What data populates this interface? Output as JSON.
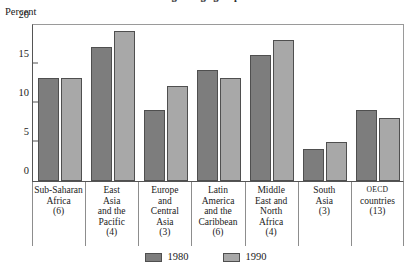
{
  "title": "Percentage of age group enrolled",
  "axis": {
    "ylabel": "Percent",
    "yticks": [
      "0",
      "5",
      "10",
      "15",
      "20"
    ]
  },
  "legend": {
    "items": [
      {
        "label": "1980",
        "color": "#7d7d7d"
      },
      {
        "label": "1990",
        "color": "#a8a8a8"
      }
    ]
  },
  "categories": [
    {
      "lines": [
        "Sub-Saharan",
        "Africa"
      ],
      "count": "(6)"
    },
    {
      "lines": [
        "East",
        "Asia",
        "and the",
        "Pacific"
      ],
      "count": "(4)"
    },
    {
      "lines": [
        "Europe",
        "and",
        "Central",
        "Asia"
      ],
      "count": "(3)"
    },
    {
      "lines": [
        "Latin",
        "America",
        "and the",
        "Caribbean"
      ],
      "count": "(6)"
    },
    {
      "lines": [
        "Middle",
        "East and",
        "North",
        "Africa"
      ],
      "count": "(4)"
    },
    {
      "lines": [
        "South",
        "Asia"
      ],
      "count": "(3)"
    },
    {
      "lines": [
        "OECD",
        "countries"
      ],
      "count": "(13)",
      "smallcaps_first": true
    }
  ],
  "chart_data": {
    "type": "bar",
    "title": "Percentage of age group enrolled",
    "xlabel": "",
    "ylabel": "Percent",
    "ylim": [
      0,
      20
    ],
    "yticks": [
      0,
      5,
      10,
      15,
      20
    ],
    "grid": false,
    "legend_position": "bottom-center",
    "categories": [
      "Sub-Saharan Africa (6)",
      "East Asia and the Pacific (4)",
      "Europe and Central Asia (3)",
      "Latin America and the Caribbean (6)",
      "Middle East and North Africa (4)",
      "South Asia (3)",
      "OECD countries (13)"
    ],
    "series": [
      {
        "name": "1980",
        "color": "#7d7d7d",
        "values": [
          13,
          17,
          9,
          14,
          16,
          4,
          9
        ]
      },
      {
        "name": "1990",
        "color": "#a8a8a8",
        "values": [
          13,
          19,
          12,
          13,
          17.8,
          5,
          8
        ]
      }
    ]
  }
}
